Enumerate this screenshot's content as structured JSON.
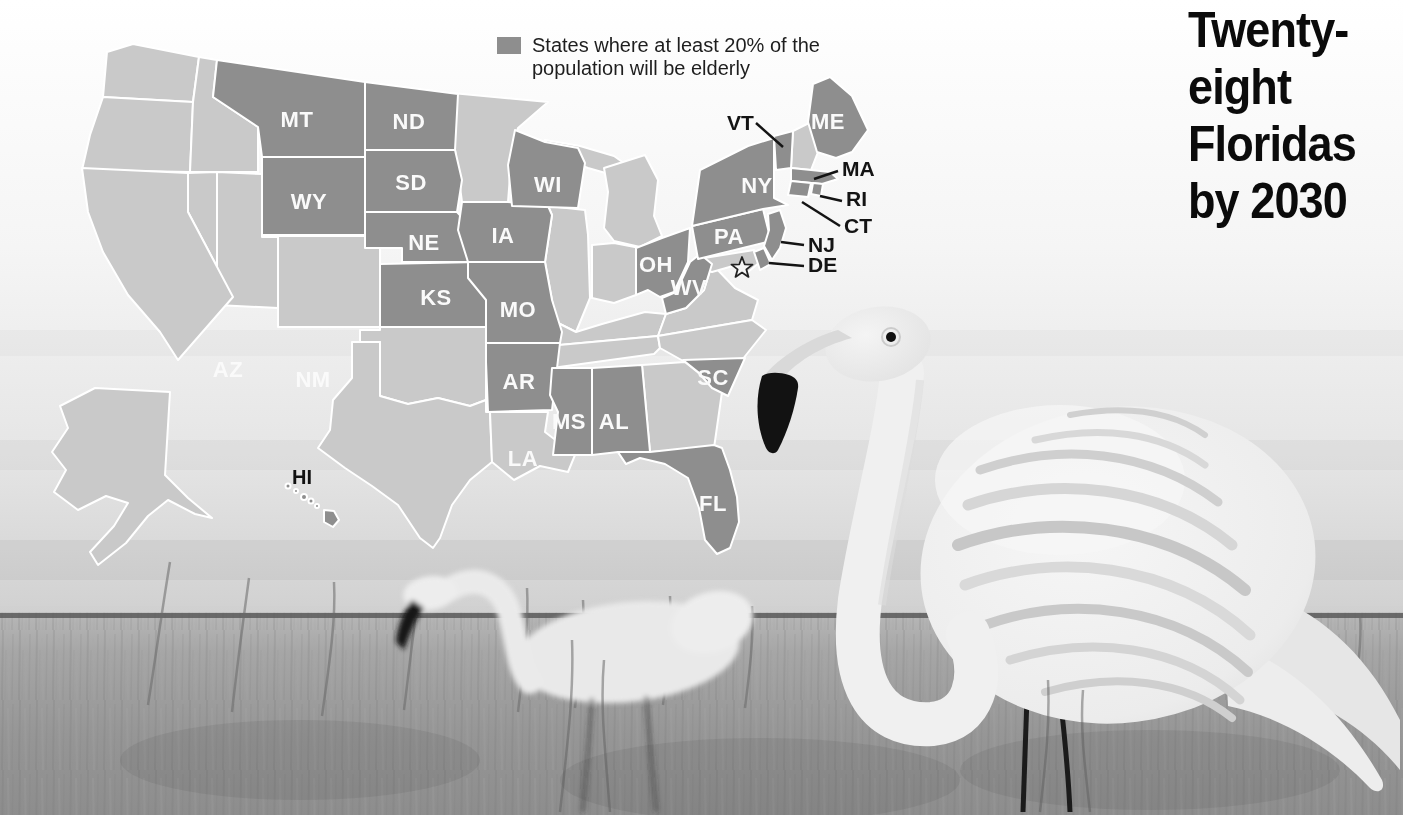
{
  "title": {
    "lines": [
      "Twenty-",
      "eight",
      "Floridas",
      "by 2030"
    ],
    "full_text": "Twenty-eight Floridas by 2030"
  },
  "legend": {
    "label": "States where at least 20% of the population will be elderly",
    "swatch_color": "#8e8e8e"
  },
  "map": {
    "colors": {
      "highlighted": "#8e8e8e",
      "other": "#c9c9c9",
      "border": "#ffffff"
    },
    "highlighted_count": 28,
    "highlighted_states": [
      "MT",
      "ND",
      "SD",
      "WY",
      "NE",
      "KS",
      "IA",
      "MO",
      "AR",
      "MS",
      "AL",
      "WI",
      "OH",
      "WV",
      "PA",
      "NY",
      "ME",
      "VT",
      "MA",
      "RI",
      "CT",
      "NJ",
      "DE",
      "SC",
      "FL",
      "AZ",
      "NM",
      "HI"
    ],
    "not_highlighted_states": [
      "WA",
      "OR",
      "ID",
      "NV",
      "CA",
      "UT",
      "CO",
      "OK",
      "TX",
      "MN",
      "IL",
      "IN",
      "MI",
      "KY",
      "TN",
      "VA",
      "NC",
      "GA",
      "LA",
      "MD",
      "NH",
      "AK"
    ],
    "state_labels": {
      "MT": "MT",
      "ND": "ND",
      "SD": "SD",
      "WY": "WY",
      "NE": "NE",
      "KS": "KS",
      "IA": "IA",
      "MO": "MO",
      "AR": "AR",
      "MS": "MS",
      "AL": "AL",
      "WI": "WI",
      "OH": "OH",
      "WV": "WV",
      "PA": "PA",
      "NY": "NY",
      "ME": "ME",
      "SC": "SC",
      "FL": "FL",
      "AZ": "AZ",
      "NM": "NM",
      "LA": "LA",
      "HI": "HI"
    },
    "callout_labels": {
      "VT": "VT",
      "MA": "MA",
      "RI": "RI",
      "CT": "CT",
      "NJ": "NJ",
      "DE": "DE"
    },
    "dc_marker_icon": "star-outline"
  },
  "photo": {
    "alt": "Two plastic lawn flamingo ornaments standing in tall grass"
  }
}
